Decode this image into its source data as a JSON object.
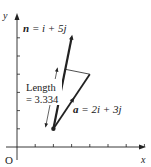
{
  "axes": {
    "x_label": "x",
    "y_label": "y",
    "origin_label": "O",
    "x_ticks": [
      1,
      2,
      3,
      4,
      5,
      6,
      7
    ],
    "y_ticks": [
      1,
      2,
      3,
      4,
      5,
      6
    ],
    "x_range": [
      0,
      7.5
    ],
    "y_range": [
      0,
      7.5
    ]
  },
  "start_point": [
    2,
    1
  ],
  "vectors": [
    {
      "id": "n",
      "components": [
        1,
        5
      ],
      "label_name": "n",
      "label_rest": " = i + 5j"
    },
    {
      "id": "a",
      "components": [
        2,
        3
      ],
      "label_name": "a",
      "label_rest": " = 2i + 3j"
    }
  ],
  "projection": {
    "label_line1": "Length",
    "label_line2": "= 3.334",
    "value": 3.334
  },
  "colors": {
    "stroke": "#222222",
    "background": "#ffffff"
  }
}
